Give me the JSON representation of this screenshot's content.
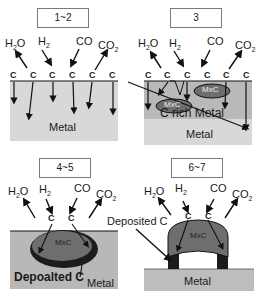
{
  "panels": [
    {
      "stage": "1~2",
      "gases": [
        {
          "base": "H",
          "sub": "2",
          "tail": "O",
          "direction": "out"
        },
        {
          "base": "H",
          "sub": "2",
          "tail": "",
          "direction": "in"
        },
        {
          "base": "CO",
          "sub": "",
          "tail": "",
          "direction": "in"
        },
        {
          "base": "CO",
          "sub": "2",
          "tail": "",
          "direction": "out"
        }
      ],
      "surface_atom": "C",
      "labels": {
        "metal": "Metal"
      }
    },
    {
      "stage": "3",
      "gases": [
        {
          "base": "H",
          "sub": "2",
          "tail": "O",
          "direction": "out"
        },
        {
          "base": "H",
          "sub": "2",
          "tail": "",
          "direction": "in"
        },
        {
          "base": "CO",
          "sub": "",
          "tail": "",
          "direction": "in"
        },
        {
          "base": "CO",
          "sub": "2",
          "tail": "",
          "direction": "out"
        }
      ],
      "surface_atom": "C",
      "labels": {
        "carbide_1": "MxC",
        "carbide_2": "MxC",
        "c_rich": "C rich Metal",
        "metal": "Metal"
      }
    },
    {
      "stage": "4~5",
      "gases": [
        {
          "base": "H",
          "sub": "2",
          "tail": "O",
          "direction": "out"
        },
        {
          "base": "H",
          "sub": "2",
          "tail": "",
          "direction": "in"
        },
        {
          "base": "CO",
          "sub": "",
          "tail": "",
          "direction": "in"
        },
        {
          "base": "CO",
          "sub": "2",
          "tail": "",
          "direction": "out"
        }
      ],
      "surface_atom": "C",
      "labels": {
        "carbide": "MxC",
        "deposited": "Depoalted C",
        "metal": "Metal"
      }
    },
    {
      "stage": "6~7",
      "gases": [
        {
          "base": "H",
          "sub": "2",
          "tail": "O",
          "direction": "out"
        },
        {
          "base": "H",
          "sub": "2",
          "tail": "",
          "direction": "in"
        },
        {
          "base": "CO",
          "sub": "",
          "tail": "",
          "direction": "in"
        },
        {
          "base": "CO",
          "sub": "2",
          "tail": "",
          "direction": "out"
        }
      ],
      "surface_atom": "C",
      "labels": {
        "carbide": "MxC",
        "deposited": "Deposited C",
        "metal": "Metal"
      }
    }
  ],
  "colors": {
    "metal": "#d8d8d8",
    "c_rich": "#b9b9b9",
    "carbide": "#6e6e6e",
    "deposited": "#1c1c1c",
    "line": "#111111"
  }
}
